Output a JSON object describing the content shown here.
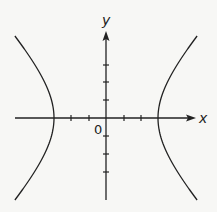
{
  "figure": {
    "type": "hyperbola-graph",
    "axes": {
      "x_label": "x",
      "y_label": "y",
      "origin_label": "0",
      "x_ticks": [
        -2,
        -1,
        1,
        2
      ],
      "y_ticks": [
        -3,
        -2,
        -1,
        1,
        2,
        3
      ]
    },
    "curve": {
      "equation_form": "x^2/a^2 - y^2/b^2 = 1",
      "vertices": [
        -3,
        3
      ],
      "branches": [
        "left",
        "right"
      ],
      "opens": "horizontally"
    },
    "colors": {
      "stroke": "#222222",
      "background": "#f7f7f5"
    }
  }
}
